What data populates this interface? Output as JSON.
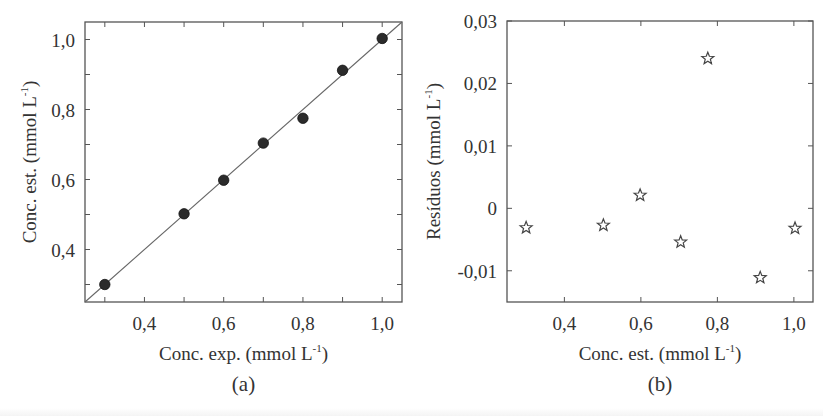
{
  "chart_data": [
    {
      "type": "scatter",
      "panel_label": "(a)",
      "title": "",
      "xlabel": "Conc. exp. (mmol L",
      "xlabel_sup": "-1",
      "xlabel_close": ")",
      "ylabel": "Conc. est.  (mmol L",
      "ylabel_sup": "-1",
      "ylabel_close": ")",
      "xlim": [
        0.25,
        1.05
      ],
      "ylim": [
        0.25,
        1.05
      ],
      "xticks": [
        0.4,
        0.6,
        0.8,
        1.0
      ],
      "xtick_labels": [
        "0,4",
        "0,6",
        "0,8",
        "1,0"
      ],
      "yticks": [
        0.4,
        0.6,
        0.8,
        1.0
      ],
      "ytick_labels": [
        "0,4",
        "0,6",
        "0,8",
        "1,0"
      ],
      "grid": false,
      "marker": "filled-circle",
      "marker_color": "#2b2b2b",
      "reference_line": "y = x",
      "series": [
        {
          "name": "estimated vs experimental",
          "x": [
            0.3,
            0.5,
            0.6,
            0.7,
            0.8,
            0.9,
            1.0
          ],
          "y": [
            0.3,
            0.502,
            0.598,
            0.704,
            0.775,
            0.912,
            1.003
          ]
        }
      ]
    },
    {
      "type": "scatter",
      "panel_label": "(b)",
      "title": "",
      "xlabel": "Conc. est. (mmol L",
      "xlabel_sup": "-1",
      "xlabel_close": ")",
      "ylabel": "Resíduos (mmol L",
      "ylabel_sup": "-1",
      "ylabel_close": ")",
      "xlim": [
        0.25,
        1.05
      ],
      "ylim": [
        -0.015,
        0.03
      ],
      "xticks": [
        0.4,
        0.6,
        0.8,
        1.0
      ],
      "xtick_labels": [
        "0,4",
        "0,6",
        "0,8",
        "1,0"
      ],
      "yticks": [
        -0.01,
        0,
        0.01,
        0.02,
        0.03
      ],
      "ytick_labels": [
        "-0,01",
        "0",
        "0,01",
        "0,02",
        "0,03"
      ],
      "grid": false,
      "marker": "open-star",
      "marker_color": "#444444",
      "series": [
        {
          "name": "residuals",
          "x": [
            0.3,
            0.502,
            0.598,
            0.704,
            0.775,
            0.912,
            1.003
          ],
          "y": [
            -0.0031,
            -0.0027,
            0.0021,
            -0.0054,
            0.024,
            -0.0111,
            -0.0032
          ]
        }
      ]
    }
  ]
}
